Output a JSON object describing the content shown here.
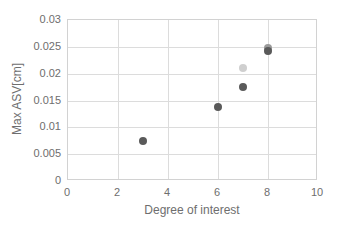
{
  "chart_data": {
    "type": "scatter",
    "title": "",
    "xlabel": "Degree of interest",
    "ylabel": "Max ASV[cm]",
    "xlim": [
      0,
      10
    ],
    "ylim": [
      0,
      0.03
    ],
    "grid": true,
    "legend": "none",
    "xticks": [
      "0",
      "2",
      "4",
      "6",
      "8",
      "10"
    ],
    "xtick_values": [
      0,
      2,
      4,
      6,
      8,
      10
    ],
    "yticks": [
      "0",
      "0.005",
      "0.01",
      "0.015",
      "0.02",
      "0.025",
      "0.03"
    ],
    "ytick_values": [
      0,
      0.005,
      0.01,
      0.015,
      0.02,
      0.025,
      0.03
    ],
    "points": [
      {
        "x": 3,
        "y": 0.0074,
        "color": "#5a5a5a",
        "size": 8
      },
      {
        "x": 6,
        "y": 0.0137,
        "color": "#5a5a5a",
        "size": 8
      },
      {
        "x": 7,
        "y": 0.021,
        "color": "#cfcfcf",
        "size": 8
      },
      {
        "x": 7,
        "y": 0.0175,
        "color": "#5a5a5a",
        "size": 8
      },
      {
        "x": 8,
        "y": 0.0247,
        "color": "#9a9a9a",
        "size": 8
      },
      {
        "x": 8,
        "y": 0.0242,
        "color": "#5a5a5a",
        "size": 8
      }
    ]
  },
  "colors": {
    "grid": "#dcdcdc",
    "frame": "#d2d2d2",
    "text": "#6e6e6e",
    "marker_dark": "#5a5a5a",
    "marker_light": "#cfcfcf",
    "marker_mid": "#9a9a9a",
    "background": "#ffffff"
  }
}
